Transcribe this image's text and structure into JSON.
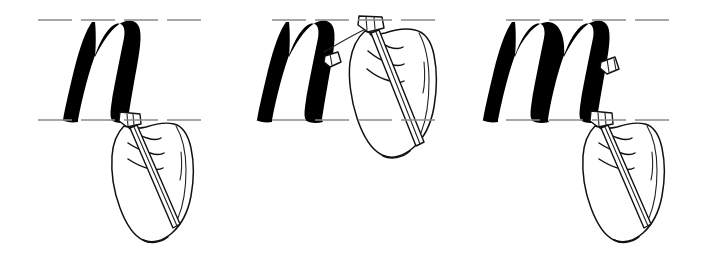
{
  "figure": {
    "kind": "calligraphy-instruction-illustration",
    "background_color": "#ffffff",
    "ink_color": "#000000",
    "guideline_color": "#8a8a8a",
    "width": 702,
    "height": 261,
    "panel_count": 3
  },
  "guidelines": {
    "style": "dashed",
    "waistline_y": 20,
    "baseline_y": 120,
    "x_height": 100,
    "left_x": 38,
    "right_x": 678
  },
  "panels": [
    {
      "index": 1,
      "letter": "n",
      "letter_state": "complete",
      "hand_position": "baseline-right",
      "pen_angle_label": "45",
      "nib_contact_y": 120,
      "stroke_note": "pen resting at baseline after finishing exit stroke"
    },
    {
      "index": 2,
      "letter": "n",
      "letter_state": "complete-with-next-stroke-started",
      "hand_position": "waistline-right",
      "pen_angle_label": "45",
      "nib_contact_y": 22,
      "stroke_note": "pen lifted to waistline beginning the third branch arch"
    },
    {
      "index": 3,
      "letter": "m",
      "letter_state": "complete",
      "hand_position": "baseline-right",
      "pen_angle_label": "45",
      "nib_contact_y": 120,
      "stroke_note": "pen back at baseline, m finished"
    }
  ],
  "elements": {
    "letter_label": "italic-minuscule",
    "hand_label": "right-hand",
    "pen_label": "broad-edge-pen",
    "nib_label": "chisel-nib"
  }
}
